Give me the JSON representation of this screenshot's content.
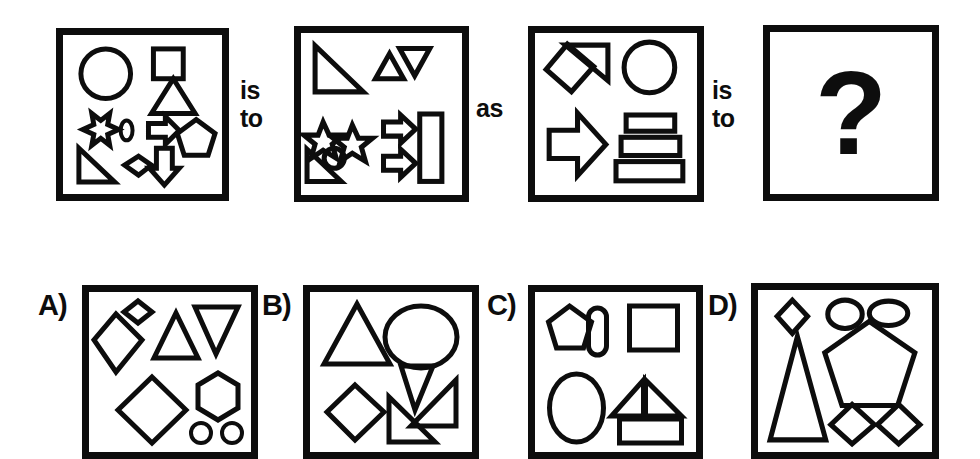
{
  "puzzle": {
    "type": "visual-analogy-matrix",
    "prompt_row": {
      "connector_1": "is\nto",
      "connector_2": "as",
      "connector_3": "is\nto",
      "answer_placeholder": "?"
    },
    "panels": [
      {
        "id": "panel-a",
        "role": "analogy-term-1",
        "shape_count": 10,
        "shapes": [
          "circle",
          "square",
          "triangle",
          "six-point-star",
          "small-oval",
          "right-triangle",
          "diamond",
          "right-arrow",
          "pentagon",
          "down-arrow"
        ]
      },
      {
        "id": "panel-b",
        "role": "analogy-term-2",
        "shape_count": 9,
        "shapes": [
          "large-right-triangle",
          "small-triangle",
          "inverted-triangle",
          "five-point-star",
          "five-point-star",
          "circle",
          "right-triangle",
          "right-arrow",
          "right-arrow",
          "vertical-rectangle"
        ]
      },
      {
        "id": "panel-c",
        "role": "analogy-term-3",
        "shape_count": 6,
        "shapes": [
          "diamond",
          "right-triangle",
          "circle",
          "right-arrow",
          "rectangle",
          "rectangle",
          "rectangle"
        ]
      },
      {
        "id": "panel-answer",
        "role": "unknown-term",
        "shape_count": 0,
        "shapes": []
      }
    ],
    "options": [
      {
        "id": "option-a",
        "label": "A)",
        "shapes": [
          "small-diamond",
          "large-diamond",
          "triangle",
          "inverted-triangle",
          "large-diamond",
          "hexagon",
          "small-circle",
          "small-circle"
        ]
      },
      {
        "id": "option-b",
        "label": "B)",
        "shapes": [
          "triangle",
          "ellipse",
          "narrow-inverted-triangle",
          "diamond",
          "right-triangle",
          "right-triangle"
        ]
      },
      {
        "id": "option-c",
        "label": "C)",
        "shapes": [
          "pentagon",
          "rounded-rectangle",
          "square",
          "ellipse",
          "triangle",
          "right-triangle",
          "rectangle"
        ]
      },
      {
        "id": "option-d",
        "label": "D)",
        "shapes": [
          "small-diamond",
          "small-ellipse",
          "small-ellipse",
          "tall-triangle",
          "large-pentagon",
          "diamond",
          "diamond"
        ]
      }
    ],
    "colors": {
      "ink": "#0d0d0d",
      "paper": "#ffffff"
    }
  }
}
